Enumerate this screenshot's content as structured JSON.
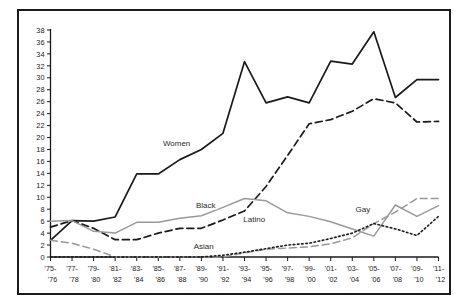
{
  "chart_data": {
    "type": "line",
    "title": "",
    "subtitle": "",
    "xlabel": "",
    "ylabel": "",
    "xlim_categories_count": 19,
    "ylim": [
      0,
      38
    ],
    "ytick_step": 2,
    "grid": false,
    "legend_position": "inline-annotations",
    "categories": [
      "'75-'76",
      "'77-'78",
      "'79-'80",
      "'81-'82",
      "'83-'84",
      "'85-'86",
      "'87-'88",
      "'89-'90",
      "'91-'92",
      "'93-'94",
      "'95-'96",
      "'97-'98",
      "'99-'00",
      "'01-'02",
      "'03-'04",
      "'05-'06",
      "'07-'08",
      "'09-'10",
      "'11-'12"
    ],
    "categories_top": [
      "'75-",
      "'77-",
      "'79-",
      "'81-",
      "'83-",
      "'85-",
      "'87-",
      "'89-",
      "'91-",
      "'93-",
      "'95-",
      "'97-",
      "'99-",
      "'01-",
      "'03-",
      "'05-",
      "'07-",
      "'09-",
      "'11-"
    ],
    "categories_bottom": [
      "'76",
      "'78",
      "'80",
      "'82",
      "'84",
      "'86",
      "'88",
      "'90",
      "'92",
      "'94",
      "'96",
      "'98",
      "'00",
      "'02",
      "'04",
      "'06",
      "'08",
      "'10",
      "'12"
    ],
    "yticks": [
      0,
      2,
      4,
      6,
      8,
      10,
      12,
      14,
      16,
      18,
      20,
      22,
      24,
      26,
      28,
      30,
      32,
      34,
      36,
      38
    ],
    "series": [
      {
        "name": "Women",
        "label": "Women",
        "style": "solid",
        "color": "#1a1a1a",
        "width": 1.7,
        "values": [
          2.8,
          6.1,
          6.0,
          6.7,
          13.9,
          13.9,
          16.3,
          18.0,
          20.7,
          32.7,
          25.8,
          26.8,
          25.8,
          32.8,
          32.3,
          37.7,
          26.7,
          29.7,
          29.7
        ]
      },
      {
        "name": "Latino",
        "label": "Latino",
        "style": "dashed",
        "color": "#1a1a1a",
        "width": 1.7,
        "values": [
          5.0,
          6.1,
          4.8,
          2.9,
          2.9,
          4.0,
          4.8,
          4.8,
          6.2,
          7.7,
          11.8,
          17.0,
          22.3,
          23.0,
          24.4,
          26.5,
          25.8,
          22.6,
          22.7
        ]
      },
      {
        "name": "Black",
        "label": "Black",
        "style": "solid",
        "color": "#999999",
        "width": 1.5,
        "values": [
          6.0,
          6.1,
          4.3,
          4.0,
          5.8,
          5.8,
          6.5,
          6.9,
          8.3,
          9.8,
          9.4,
          7.4,
          6.8,
          5.9,
          4.7,
          3.5,
          8.7,
          6.8,
          8.6
        ]
      },
      {
        "name": "Asian",
        "label": "Asian",
        "style": "dashed",
        "color": "#999999",
        "width": 1.5,
        "values": [
          2.8,
          2.3,
          1.3,
          0.0,
          0.0,
          0.0,
          0.0,
          0.0,
          0.0,
          0.7,
          1.3,
          1.5,
          1.7,
          2.2,
          3.2,
          5.6,
          7.5,
          9.8,
          9.8
        ]
      },
      {
        "name": "Gay",
        "label": "Gay",
        "style": "dotted",
        "color": "#1a1a1a",
        "width": 1.6,
        "values": [
          0.0,
          0.0,
          0.0,
          0.0,
          0.0,
          0.0,
          0.0,
          0.0,
          0.3,
          0.8,
          1.4,
          2.0,
          2.3,
          3.1,
          4.0,
          5.6,
          4.7,
          3.6,
          6.8
        ]
      }
    ],
    "annotations": [
      {
        "text": "Women",
        "x_frac": 0.325,
        "value": 18.6
      },
      {
        "text": "Black",
        "x_frac": 0.4,
        "value": 8.2
      },
      {
        "text": "Latino",
        "x_frac": 0.525,
        "value": 5.9
      },
      {
        "text": "Asian",
        "x_frac": 0.395,
        "value": 1.3
      },
      {
        "text": "Gay",
        "x_frac": 0.805,
        "value": 7.5
      }
    ]
  },
  "colors": {
    "axis": "#1a1a1a",
    "frame": "#1a1a1a",
    "background": "#ffffff",
    "primary_series": "#1a1a1a",
    "secondary_series": "#999999"
  }
}
